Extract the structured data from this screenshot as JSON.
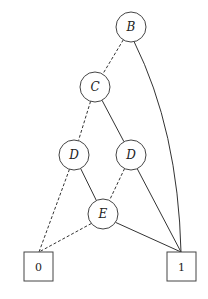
{
  "diagram": {
    "type": "binary-decision-diagram",
    "nodes": [
      {
        "id": "B",
        "label": "B",
        "kind": "decision"
      },
      {
        "id": "C",
        "label": "C",
        "kind": "decision"
      },
      {
        "id": "D1",
        "label": "D",
        "kind": "decision"
      },
      {
        "id": "D2",
        "label": "D",
        "kind": "decision"
      },
      {
        "id": "E",
        "label": "E",
        "kind": "decision"
      },
      {
        "id": "T0",
        "label": "0",
        "kind": "terminal"
      },
      {
        "id": "T1",
        "label": "1",
        "kind": "terminal"
      }
    ],
    "edges": [
      {
        "from": "B",
        "to": "C",
        "style": "dashed"
      },
      {
        "from": "B",
        "to": "T1",
        "style": "solid"
      },
      {
        "from": "C",
        "to": "D1",
        "style": "dashed"
      },
      {
        "from": "C",
        "to": "D2",
        "style": "solid"
      },
      {
        "from": "D1",
        "to": "T0",
        "style": "dashed"
      },
      {
        "from": "D1",
        "to": "E",
        "style": "solid"
      },
      {
        "from": "D2",
        "to": "E",
        "style": "dashed"
      },
      {
        "from": "D2",
        "to": "T1",
        "style": "solid"
      },
      {
        "from": "E",
        "to": "T0",
        "style": "dashed"
      },
      {
        "from": "E",
        "to": "T1",
        "style": "solid"
      }
    ]
  }
}
